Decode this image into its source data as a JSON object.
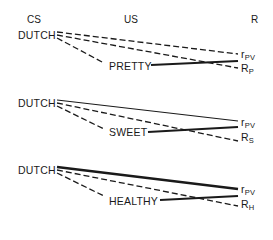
{
  "headers": {
    "cs": "CS",
    "us": "US",
    "r": "R"
  },
  "panels": [
    {
      "cs_label": "DUTCH",
      "us_label": "PRETTY",
      "r_top": {
        "symbol": "r",
        "sub": "PV"
      },
      "r_bottom": {
        "symbol": "R",
        "sub": "P"
      },
      "cs_to_r_top_style": "dashed",
      "cs_to_r_bottom_style": "dashed",
      "cs_to_us_style": "dashed",
      "us_to_r_style": "thick-solid"
    },
    {
      "cs_label": "DUTCH",
      "us_label": "SWEET",
      "r_top": {
        "symbol": "r",
        "sub": "PV"
      },
      "r_bottom": {
        "symbol": "R",
        "sub": "S"
      },
      "cs_to_r_top_style": "thin-solid",
      "cs_to_r_bottom_style": "dashed",
      "cs_to_us_style": "dashed",
      "us_to_r_style": "thick-solid"
    },
    {
      "cs_label": "DUTCH",
      "us_label": "HEALTHY",
      "r_top": {
        "symbol": "r",
        "sub": "PV"
      },
      "r_bottom": {
        "symbol": "R",
        "sub": "H"
      },
      "cs_to_r_top_style": "thick-solid",
      "cs_to_r_bottom_style": "dashed",
      "cs_to_us_style": "dashed",
      "us_to_r_style": "thick-solid"
    }
  ],
  "colors": {
    "ink": "#1a1a1a",
    "background": "#ffffff"
  }
}
